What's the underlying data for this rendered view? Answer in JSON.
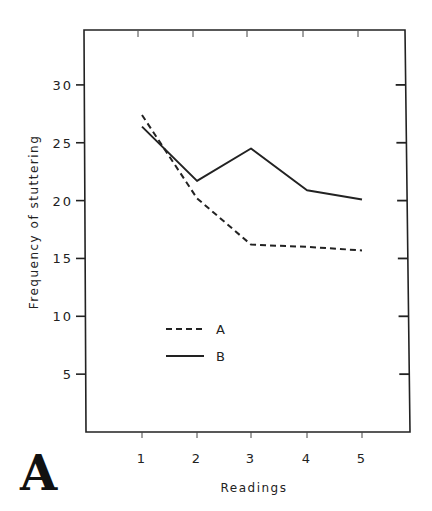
{
  "panel_label": "A",
  "chart_data": {
    "type": "line",
    "title": "",
    "xlabel": "Readings",
    "ylabel": "Frequency of stuttering",
    "x": [
      1,
      2,
      3,
      4,
      5
    ],
    "x_tick_labels": [
      "1",
      "2",
      "3",
      "4",
      "5"
    ],
    "y_tick_values": [
      5,
      10,
      15,
      20,
      25,
      30
    ],
    "y_tick_labels": [
      "5",
      "10",
      "15",
      "20",
      "25",
      "30"
    ],
    "xlim": [
      0,
      6
    ],
    "ylim": [
      0,
      35
    ],
    "grid": false,
    "legend_position": "inside lower-center",
    "series": [
      {
        "name": "A",
        "style": "dashed",
        "values": [
          27.4,
          20.2,
          16.2,
          16.0,
          15.7
        ]
      },
      {
        "name": "B",
        "style": "solid",
        "values": [
          26.4,
          21.7,
          24.5,
          20.9,
          20.1
        ]
      }
    ],
    "colors": {
      "line": "#222222",
      "axis": "#222222"
    }
  }
}
